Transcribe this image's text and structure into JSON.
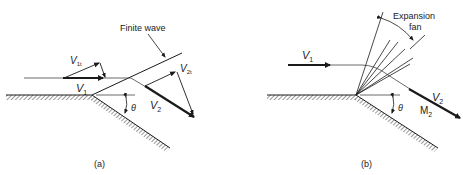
{
  "figure": {
    "panel_a": {
      "caption": "(a)",
      "wave_label": "Finite wave",
      "v1_label": "V",
      "v1_sub": "1",
      "v1t_label": "V",
      "v1t_sub": "1t",
      "v2_label": "V",
      "v2_sub": "2",
      "v2t_label": "V",
      "v2t_sub": "2t",
      "angle_label": "θ"
    },
    "panel_b": {
      "caption": "(b)",
      "fan_label_line1": "Expansion",
      "fan_label_line2": "fan",
      "v1_label": "V",
      "v1_sub": "1",
      "v2_label": "V",
      "v2_sub": "2",
      "m2_label": "M",
      "m2_sub": "2",
      "angle_label": "θ"
    },
    "colors": {
      "ink": "#1a1a1a",
      "thin": "#444444"
    }
  }
}
